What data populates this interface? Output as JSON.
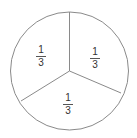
{
  "diagram": {
    "type": "fraction-circle",
    "parts": 3,
    "stroke_color": "#8a8a8a",
    "sections": [
      {
        "position": "top-left",
        "numerator": "1",
        "denominator": "3"
      },
      {
        "position": "top-right",
        "numerator": "1",
        "denominator": "3"
      },
      {
        "position": "bottom",
        "numerator": "1",
        "denominator": "3"
      }
    ]
  }
}
